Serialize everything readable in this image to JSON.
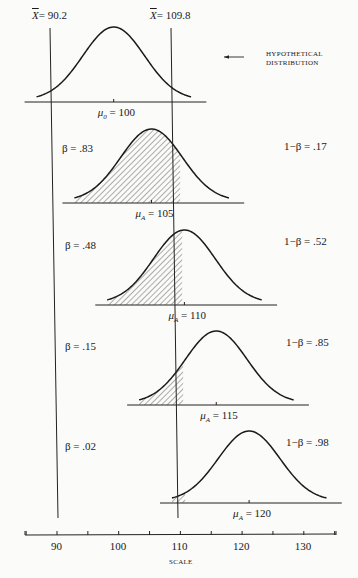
{
  "critical_values": {
    "lower": {
      "label_var": "X",
      "label_value": "= 90.2",
      "value": 90.2
    },
    "upper": {
      "label_var": "X",
      "label_value": "= 109.8",
      "value": 109.8
    }
  },
  "hypothetical_label": {
    "line1": "HYPOTHETICAL",
    "line2": "DISTRIBUTION"
  },
  "distributions": [
    {
      "mean": 100,
      "mean_sym": "μ",
      "mean_sub": "0",
      "mean_text": "= 100",
      "beta": "",
      "power": "",
      "shade": "none"
    },
    {
      "mean": 105,
      "mean_sym": "μ",
      "mean_sub": "A",
      "mean_text": "= 105",
      "beta": "β = .83",
      "power": "1−β = .17",
      "shade": "left"
    },
    {
      "mean": 110,
      "mean_sym": "μ",
      "mean_sub": "A",
      "mean_text": "= 110",
      "beta": "β = .48",
      "power": "1−β = .52",
      "shade": "left"
    },
    {
      "mean": 115,
      "mean_sym": "μ",
      "mean_sub": "A",
      "mean_text": "= 115",
      "beta": "β = .15",
      "power": "1−β = .85",
      "shade": "left"
    },
    {
      "mean": 120,
      "mean_sym": "μ",
      "mean_sub": "A",
      "mean_text": "= 120",
      "beta": "β = .02",
      "power": "1−β = .98",
      "shade": "left"
    }
  ],
  "scale": {
    "label": "SCALE",
    "ticks": [
      "90",
      "100",
      "110",
      "120",
      "130"
    ],
    "tick_values": [
      85,
      90,
      95,
      100,
      105,
      110,
      115,
      120,
      125,
      130,
      135
    ]
  }
}
